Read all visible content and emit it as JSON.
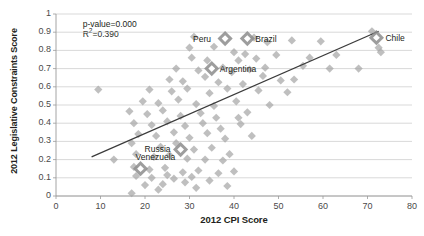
{
  "chart_data": {
    "type": "scatter",
    "title": "",
    "xlabel": "2012 CPI Score",
    "ylabel": "2012 Legislative Constraints Score",
    "xlim": [
      0,
      80
    ],
    "ylim": [
      0,
      1
    ],
    "xticks": [
      "0",
      "10",
      "20",
      "30",
      "40",
      "50",
      "60",
      "70",
      "80"
    ],
    "yticks": [
      "0",
      "0.1",
      "0.2",
      "0.3",
      "0.4",
      "0.5",
      "0.6",
      "0.7",
      "0.8",
      "0.9",
      "1"
    ],
    "grid": "horizontal",
    "legend": "none",
    "marker_shape": "diamond",
    "marker_color": "#a6a6a6",
    "highlight_color": "#8c8c8c",
    "trendline_color": "#3b3b3b",
    "annotations": [
      {
        "text": "p-value=0.000",
        "x": 6,
        "y": 0.945
      },
      {
        "text": "R2=0.390",
        "x": 6,
        "y": 0.888
      }
    ],
    "statistics": {
      "p_value": "p-value=0.000",
      "r_squared_label": "R",
      "r_squared_exponent": "2",
      "r_squared_value": "=0.390"
    },
    "trendline": {
      "x0": 8.0,
      "y0": 0.215,
      "x1": 72.5,
      "y1": 0.905
    },
    "labeled_points": [
      {
        "name": "Peru",
        "x": 38.0,
        "y": 0.865,
        "label_dx": -30,
        "label_dy": -4
      },
      {
        "name": "Brazil",
        "x": 43.0,
        "y": 0.865,
        "label_dx": 8,
        "label_dy": -4
      },
      {
        "name": "Argentina",
        "x": 35.0,
        "y": 0.7,
        "label_dx": 8,
        "label_dy": -4
      },
      {
        "name": "Chile",
        "x": 72.0,
        "y": 0.87,
        "label_dx": 9,
        "label_dy": -4
      },
      {
        "name": "Russia",
        "x": 28.0,
        "y": 0.255,
        "label_dx": -34,
        "label_dy": -5
      },
      {
        "name": "Venezuela",
        "x": 19.0,
        "y": 0.15,
        "label_dx": -3,
        "label_dy": -16
      }
    ],
    "points": [
      {
        "x": 9.5,
        "y": 0.585
      },
      {
        "x": 31.0,
        "y": 0.875
      },
      {
        "x": 40.0,
        "y": 0.79
      },
      {
        "x": 44.5,
        "y": 0.87
      },
      {
        "x": 47.5,
        "y": 0.845
      },
      {
        "x": 53.0,
        "y": 0.855
      },
      {
        "x": 59.5,
        "y": 0.85
      },
      {
        "x": 71.0,
        "y": 0.905
      },
      {
        "x": 72.5,
        "y": 0.815
      },
      {
        "x": 73.0,
        "y": 0.79
      },
      {
        "x": 30.5,
        "y": 0.76
      },
      {
        "x": 34.0,
        "y": 0.745
      },
      {
        "x": 41.0,
        "y": 0.745
      },
      {
        "x": 45.0,
        "y": 0.755
      },
      {
        "x": 49.5,
        "y": 0.775
      },
      {
        "x": 57.0,
        "y": 0.76
      },
      {
        "x": 63.0,
        "y": 0.775
      },
      {
        "x": 27.0,
        "y": 0.7
      },
      {
        "x": 32.0,
        "y": 0.69
      },
      {
        "x": 37.5,
        "y": 0.705
      },
      {
        "x": 39.5,
        "y": 0.68
      },
      {
        "x": 43.5,
        "y": 0.695
      },
      {
        "x": 46.5,
        "y": 0.66
      },
      {
        "x": 55.5,
        "y": 0.715
      },
      {
        "x": 61.5,
        "y": 0.7
      },
      {
        "x": 68.0,
        "y": 0.7
      },
      {
        "x": 25.5,
        "y": 0.64
      },
      {
        "x": 28.5,
        "y": 0.63
      },
      {
        "x": 33.5,
        "y": 0.655
      },
      {
        "x": 36.5,
        "y": 0.625
      },
      {
        "x": 42.0,
        "y": 0.615
      },
      {
        "x": 50.5,
        "y": 0.635
      },
      {
        "x": 21.0,
        "y": 0.585
      },
      {
        "x": 26.0,
        "y": 0.575
      },
      {
        "x": 29.5,
        "y": 0.59
      },
      {
        "x": 34.5,
        "y": 0.565
      },
      {
        "x": 38.5,
        "y": 0.59
      },
      {
        "x": 45.5,
        "y": 0.58
      },
      {
        "x": 52.0,
        "y": 0.57
      },
      {
        "x": 19.5,
        "y": 0.52
      },
      {
        "x": 23.0,
        "y": 0.51
      },
      {
        "x": 27.5,
        "y": 0.53
      },
      {
        "x": 31.5,
        "y": 0.505
      },
      {
        "x": 35.5,
        "y": 0.495
      },
      {
        "x": 40.5,
        "y": 0.52
      },
      {
        "x": 48.0,
        "y": 0.5
      },
      {
        "x": 16.5,
        "y": 0.465
      },
      {
        "x": 20.5,
        "y": 0.45
      },
      {
        "x": 24.0,
        "y": 0.47
      },
      {
        "x": 28.0,
        "y": 0.44
      },
      {
        "x": 32.5,
        "y": 0.455
      },
      {
        "x": 36.0,
        "y": 0.43
      },
      {
        "x": 43.0,
        "y": 0.46
      },
      {
        "x": 17.5,
        "y": 0.4
      },
      {
        "x": 21.5,
        "y": 0.39
      },
      {
        "x": 25.0,
        "y": 0.41
      },
      {
        "x": 29.0,
        "y": 0.385
      },
      {
        "x": 33.0,
        "y": 0.4
      },
      {
        "x": 37.0,
        "y": 0.37
      },
      {
        "x": 41.5,
        "y": 0.395
      },
      {
        "x": 18.5,
        "y": 0.34
      },
      {
        "x": 22.5,
        "y": 0.33
      },
      {
        "x": 26.5,
        "y": 0.35
      },
      {
        "x": 30.0,
        "y": 0.32
      },
      {
        "x": 34.0,
        "y": 0.345
      },
      {
        "x": 38.0,
        "y": 0.315
      },
      {
        "x": 13.0,
        "y": 0.2
      },
      {
        "x": 17.0,
        "y": 0.29
      },
      {
        "x": 23.5,
        "y": 0.27
      },
      {
        "x": 27.0,
        "y": 0.29
      },
      {
        "x": 31.0,
        "y": 0.255
      },
      {
        "x": 35.0,
        "y": 0.265
      },
      {
        "x": 39.0,
        "y": 0.23
      },
      {
        "x": 18.0,
        "y": 0.23
      },
      {
        "x": 22.0,
        "y": 0.215
      },
      {
        "x": 25.5,
        "y": 0.225
      },
      {
        "x": 29.5,
        "y": 0.205
      },
      {
        "x": 33.5,
        "y": 0.2
      },
      {
        "x": 37.5,
        "y": 0.195
      },
      {
        "x": 17.5,
        "y": 0.16
      },
      {
        "x": 21.0,
        "y": 0.145
      },
      {
        "x": 24.5,
        "y": 0.155
      },
      {
        "x": 28.5,
        "y": 0.13
      },
      {
        "x": 32.0,
        "y": 0.14
      },
      {
        "x": 36.5,
        "y": 0.125
      },
      {
        "x": 40.0,
        "y": 0.135
      },
      {
        "x": 18.0,
        "y": 0.11
      },
      {
        "x": 21.5,
        "y": 0.1
      },
      {
        "x": 25.0,
        "y": 0.115
      },
      {
        "x": 26.5,
        "y": 0.095
      },
      {
        "x": 30.5,
        "y": 0.105
      },
      {
        "x": 20.0,
        "y": 0.06
      },
      {
        "x": 24.0,
        "y": 0.065
      },
      {
        "x": 31.5,
        "y": 0.045
      },
      {
        "x": 17.0,
        "y": 0.015
      },
      {
        "x": 23.0,
        "y": 0.035
      },
      {
        "x": 29.0,
        "y": 0.075
      },
      {
        "x": 34.5,
        "y": 0.085
      },
      {
        "x": 38.5,
        "y": 0.055
      },
      {
        "x": 41.0,
        "y": 0.43
      },
      {
        "x": 44.0,
        "y": 0.33
      },
      {
        "x": 53.5,
        "y": 0.64
      },
      {
        "x": 47.0,
        "y": 0.705
      },
      {
        "x": 35.5,
        "y": 0.82
      },
      {
        "x": 42.5,
        "y": 0.78
      },
      {
        "x": 30.0,
        "y": 0.815
      }
    ]
  }
}
